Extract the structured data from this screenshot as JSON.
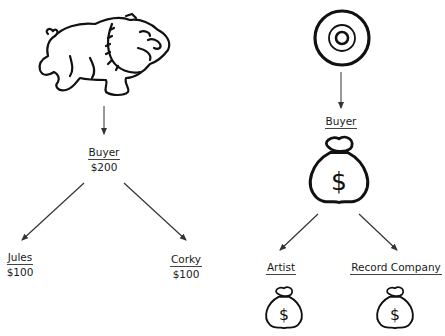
{
  "left_diagram": {
    "source": {
      "icon": "bulldog-icon"
    },
    "buyer": {
      "name": "Buyer",
      "amount": "$200"
    },
    "recipients": [
      {
        "name": "Jules",
        "amount": "$100"
      },
      {
        "name": "Corky",
        "amount": "$100"
      }
    ]
  },
  "right_diagram": {
    "source": {
      "icon": "record-disc-icon"
    },
    "buyer": {
      "name": "Buyer",
      "icon": "money-bag-icon",
      "symbol": "$"
    },
    "recipients": [
      {
        "name": "Artist",
        "icon": "money-bag-icon",
        "symbol": "$"
      },
      {
        "name": "Record Company",
        "icon": "money-bag-icon",
        "symbol": "$"
      }
    ]
  },
  "colors": {
    "ink": "#1a1a1a",
    "background": "#ffffff"
  }
}
